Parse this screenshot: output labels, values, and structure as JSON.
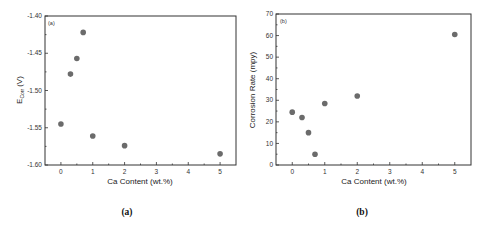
{
  "chart_data": [
    {
      "type": "scatter",
      "panel_label": "(a)",
      "caption": "(a)",
      "title": "",
      "xlabel": "Ca Content (wt.%)",
      "ylabel": "E_corr (V)",
      "ylabel_main": "E",
      "ylabel_sub": "Corr",
      "ylabel_unit": "(V)",
      "xlim": [
        -0.5,
        5.5
      ],
      "ylim": [
        -1.6,
        -1.4
      ],
      "xticks": [
        0,
        1,
        2,
        3,
        4,
        5
      ],
      "xtick_labels": [
        "0",
        "1",
        "2",
        "3",
        "4",
        "5"
      ],
      "yticks": [
        -1.4,
        -1.45,
        -1.5,
        -1.55,
        -1.6
      ],
      "ytick_labels": [
        "-1.40",
        "-1.45",
        "-1.50",
        "-1.55",
        "-1.60"
      ],
      "grid": false,
      "legend": null,
      "x": [
        0,
        0.3,
        0.5,
        0.7,
        1,
        2,
        5
      ],
      "y": [
        -1.545,
        -1.478,
        -1.457,
        -1.422,
        -1.561,
        -1.574,
        -1.585
      ],
      "marker_color": "#6b6b6b"
    },
    {
      "type": "scatter",
      "panel_label": "(b)",
      "caption": "(b)",
      "title": "",
      "xlabel": "Ca Content (wt.%)",
      "ylabel": "Corrosion Rate (mpy)",
      "xlim": [
        -0.5,
        5.5
      ],
      "ylim": [
        0,
        70
      ],
      "xticks": [
        0,
        1,
        2,
        3,
        4,
        5
      ],
      "xtick_labels": [
        "0",
        "1",
        "2",
        "3",
        "4",
        "5"
      ],
      "yticks": [
        0,
        10,
        20,
        30,
        40,
        50,
        60,
        70
      ],
      "ytick_labels": [
        "0",
        "10",
        "20",
        "30",
        "40",
        "50",
        "60",
        "70"
      ],
      "grid": false,
      "legend": null,
      "x": [
        0,
        0.3,
        0.5,
        0.7,
        1,
        2,
        5
      ],
      "y": [
        24.5,
        22,
        15,
        5,
        28.5,
        32,
        60.5
      ],
      "marker_color": "#6b6b6b"
    }
  ]
}
